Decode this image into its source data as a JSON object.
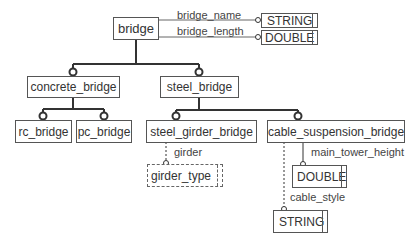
{
  "diagram": {
    "type": "class-hierarchy",
    "root": {
      "label": "bridge"
    },
    "nodes": [
      {
        "id": "bridge",
        "label": "bridge"
      },
      {
        "id": "concrete_bridge",
        "label": "concrete_bridge"
      },
      {
        "id": "steel_bridge",
        "label": "steel_bridge"
      },
      {
        "id": "rc_bridge",
        "label": "rc_bridge"
      },
      {
        "id": "pc_bridge",
        "label": "pc_bridge"
      },
      {
        "id": "steel_girder_bridge",
        "label": "steel_girder_bridge"
      },
      {
        "id": "cable_suspension_bridge",
        "label": "cable_suspension_bridge"
      },
      {
        "id": "string_type_top",
        "label": "STRING"
      },
      {
        "id": "double_type_top",
        "label": "DOUBLE"
      },
      {
        "id": "girder_type",
        "label": "girder_type"
      },
      {
        "id": "double_type_cable",
        "label": "DOUBLE"
      },
      {
        "id": "string_type_cable",
        "label": "STRING"
      }
    ],
    "attributes": [
      {
        "from": "bridge",
        "name": "bridge_name",
        "to": "STRING",
        "style": "solid"
      },
      {
        "from": "bridge",
        "name": "bridge_length",
        "to": "DOUBLE",
        "style": "solid"
      },
      {
        "from": "steel_girder_bridge",
        "name": "girder",
        "to": "girder_type",
        "style": "dashed"
      },
      {
        "from": "cable_suspension_bridge",
        "name": "main_tower_height",
        "to": "DOUBLE",
        "style": "solid"
      },
      {
        "from": "cable_suspension_bridge",
        "name": "cable_style",
        "to": "STRING",
        "style": "dashed"
      }
    ],
    "inheritance": [
      {
        "parent": "bridge",
        "children": [
          "concrete_bridge",
          "steel_bridge"
        ]
      },
      {
        "parent": "concrete_bridge",
        "children": [
          "rc_bridge",
          "pc_bridge"
        ]
      },
      {
        "parent": "steel_bridge",
        "children": [
          "steel_girder_bridge",
          "cable_suspension_bridge"
        ]
      }
    ]
  },
  "labels": {
    "bridge": "bridge",
    "concrete_bridge": "concrete_bridge",
    "steel_bridge": "steel_bridge",
    "rc_bridge": "rc_bridge",
    "pc_bridge": "pc_bridge",
    "steel_girder_bridge": "steel_girder_bridge",
    "cable_suspension_bridge": "cable_suspension_bridge",
    "string_top": "STRING",
    "double_top": "DOUBLE",
    "girder_type": "girder_type",
    "double_cable": "DOUBLE",
    "string_cable": "STRING",
    "bridge_name": "bridge_name",
    "bridge_length": "bridge_length",
    "girder": "girder",
    "main_tower_height": "main_tower_height",
    "cable_style": "cable_style"
  },
  "colors": {
    "line": "#333333",
    "box_border": "#555555",
    "text": "#333333",
    "background": "#ffffff"
  }
}
